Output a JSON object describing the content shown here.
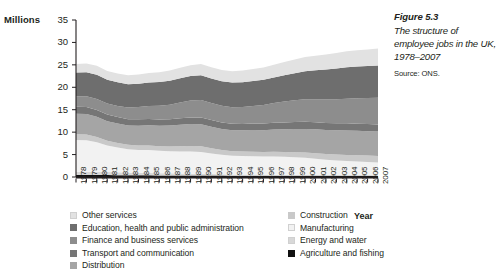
{
  "caption": {
    "figure_number": "Figure 5.3",
    "title": "The structure of employee jobs in the UK, 1978–2007",
    "source": "Source: ONS."
  },
  "axes": {
    "y_unit_label": "Millions",
    "x_axis_name": "Year"
  },
  "colors": {
    "other_services": "#e2e2e2",
    "education_health_public": "#6e6e6e",
    "finance_business": "#8d8d8d",
    "transport_communication": "#767676",
    "distribution": "#a5a5a5",
    "construction": "#c9c9c9",
    "manufacturing": "#f2f2f2",
    "energy_water": "#d8d8d8",
    "agriculture_fishing": "#111111",
    "axis": "#231f20",
    "text": "#231f20"
  },
  "chart_data": {
    "type": "area",
    "stacked": true,
    "title": "The structure of employee jobs in the UK, 1978–2007",
    "xlabel": "Year",
    "ylabel": "Millions",
    "ylim": [
      0,
      35
    ],
    "y_ticks": [
      0,
      5,
      10,
      15,
      20,
      25,
      30,
      35
    ],
    "grid": false,
    "legend_position": "below",
    "categories": [
      "1978",
      "1979",
      "1980",
      "1981",
      "1982",
      "1983",
      "1984",
      "1985",
      "1986",
      "1987",
      "1988",
      "1989",
      "1990",
      "1991",
      "1992",
      "1993",
      "1994",
      "1995",
      "1996",
      "1997",
      "1998",
      "1999",
      "2000",
      "2001",
      "2002",
      "2003",
      "2004",
      "2005",
      "2006",
      "2007"
    ],
    "stack_order_bottom_to_top": [
      "Agriculture and fishing",
      "Energy and water",
      "Manufacturing",
      "Construction",
      "Distribution",
      "Transport and communication",
      "Finance and business services",
      "Education, health and public administration",
      "Other services"
    ],
    "series": [
      {
        "name": "Agriculture and fishing",
        "color": "#111111",
        "values": [
          0.45,
          0.45,
          0.44,
          0.42,
          0.4,
          0.38,
          0.38,
          0.37,
          0.36,
          0.35,
          0.34,
          0.33,
          0.33,
          0.32,
          0.31,
          0.3,
          0.3,
          0.3,
          0.29,
          0.29,
          0.28,
          0.28,
          0.27,
          0.27,
          0.26,
          0.26,
          0.25,
          0.25,
          0.24,
          0.24
        ]
      },
      {
        "name": "Energy and water",
        "color": "#d8d8d8",
        "values": [
          0.72,
          0.72,
          0.7,
          0.68,
          0.65,
          0.6,
          0.56,
          0.54,
          0.5,
          0.46,
          0.42,
          0.38,
          0.35,
          0.33,
          0.31,
          0.28,
          0.26,
          0.25,
          0.24,
          0.23,
          0.22,
          0.21,
          0.2,
          0.2,
          0.19,
          0.19,
          0.18,
          0.18,
          0.18,
          0.17
        ]
      },
      {
        "name": "Manufacturing",
        "color": "#f2f2f2",
        "values": [
          7.1,
          7.05,
          6.6,
          5.9,
          5.5,
          5.2,
          5.1,
          5.1,
          5.0,
          4.95,
          4.95,
          4.95,
          4.9,
          4.6,
          4.35,
          4.15,
          4.1,
          4.1,
          4.05,
          4.05,
          4.0,
          3.9,
          3.8,
          3.6,
          3.4,
          3.25,
          3.15,
          3.05,
          2.95,
          2.85
        ]
      },
      {
        "name": "Construction",
        "color": "#c9c9c9",
        "values": [
          1.25,
          1.25,
          1.2,
          1.1,
          1.05,
          1.0,
          1.0,
          1.0,
          1.0,
          1.05,
          1.15,
          1.25,
          1.25,
          1.15,
          1.05,
          1.0,
          1.0,
          1.0,
          1.0,
          1.05,
          1.1,
          1.15,
          1.2,
          1.25,
          1.28,
          1.3,
          1.35,
          1.38,
          1.4,
          1.42
        ]
      },
      {
        "name": "Distribution",
        "color": "#a5a5a5",
        "values": [
          4.6,
          4.6,
          4.5,
          4.35,
          4.3,
          4.3,
          4.4,
          4.5,
          4.55,
          4.65,
          4.8,
          4.9,
          4.95,
          4.8,
          4.7,
          4.7,
          4.75,
          4.8,
          4.85,
          4.95,
          5.05,
          5.15,
          5.25,
          5.3,
          5.35,
          5.4,
          5.45,
          5.45,
          5.45,
          5.45
        ]
      },
      {
        "name": "Transport and communication",
        "color": "#767676",
        "values": [
          1.55,
          1.55,
          1.52,
          1.48,
          1.45,
          1.42,
          1.42,
          1.42,
          1.42,
          1.42,
          1.45,
          1.48,
          1.5,
          1.48,
          1.45,
          1.42,
          1.42,
          1.45,
          1.48,
          1.5,
          1.52,
          1.55,
          1.58,
          1.58,
          1.58,
          1.58,
          1.58,
          1.58,
          1.58,
          1.58
        ]
      },
      {
        "name": "Finance and business services",
        "color": "#8d8d8d",
        "values": [
          2.3,
          2.4,
          2.45,
          2.45,
          2.5,
          2.6,
          2.75,
          2.9,
          3.05,
          3.25,
          3.5,
          3.75,
          3.9,
          3.8,
          3.7,
          3.7,
          3.8,
          3.95,
          4.15,
          4.4,
          4.65,
          4.85,
          5.05,
          5.15,
          5.25,
          5.35,
          5.5,
          5.65,
          5.8,
          5.95
        ]
      },
      {
        "name": "Education, health and public administration",
        "color": "#6e6e6e",
        "values": [
          5.3,
          5.35,
          5.4,
          5.3,
          5.25,
          5.2,
          5.2,
          5.25,
          5.3,
          5.35,
          5.4,
          5.45,
          5.5,
          5.5,
          5.5,
          5.5,
          5.5,
          5.55,
          5.6,
          5.7,
          5.85,
          6.05,
          6.25,
          6.45,
          6.65,
          6.85,
          7.0,
          7.1,
          7.15,
          7.2
        ]
      },
      {
        "name": "Other services",
        "color": "#e2e2e2",
        "values": [
          1.9,
          1.95,
          1.98,
          1.95,
          1.95,
          2.0,
          2.05,
          2.1,
          2.15,
          2.25,
          2.35,
          2.45,
          2.5,
          2.5,
          2.5,
          2.55,
          2.6,
          2.65,
          2.75,
          2.85,
          2.95,
          3.05,
          3.15,
          3.25,
          3.35,
          3.45,
          3.55,
          3.62,
          3.7,
          3.78
        ]
      }
    ]
  },
  "legend": {
    "left_column": [
      {
        "label": "Other services",
        "color": "#e2e2e2"
      },
      {
        "label": "Education, health and public administration",
        "color": "#6e6e6e"
      },
      {
        "label": "Finance and business services",
        "color": "#8d8d8d"
      },
      {
        "label": "Transport and communication",
        "color": "#767676"
      },
      {
        "label": "Distribution",
        "color": "#a5a5a5"
      }
    ],
    "right_column": [
      {
        "label": "Construction",
        "color": "#c9c9c9"
      },
      {
        "label": "Manufacturing",
        "color": "#f2f2f2"
      },
      {
        "label": "Energy and water",
        "color": "#d8d8d8"
      },
      {
        "label": "Agriculture and fishing",
        "color": "#111111"
      }
    ]
  }
}
